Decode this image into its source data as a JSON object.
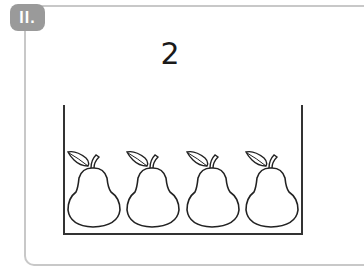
{
  "badge": {
    "label": "II."
  },
  "exercise": {
    "number": "2",
    "items": [
      {
        "type": "pear"
      },
      {
        "type": "pear"
      },
      {
        "type": "pear"
      },
      {
        "type": "pear"
      }
    ]
  },
  "colors": {
    "frame": "#c8c8c8",
    "badge": "#9a9a9a",
    "outline": "#333333"
  }
}
